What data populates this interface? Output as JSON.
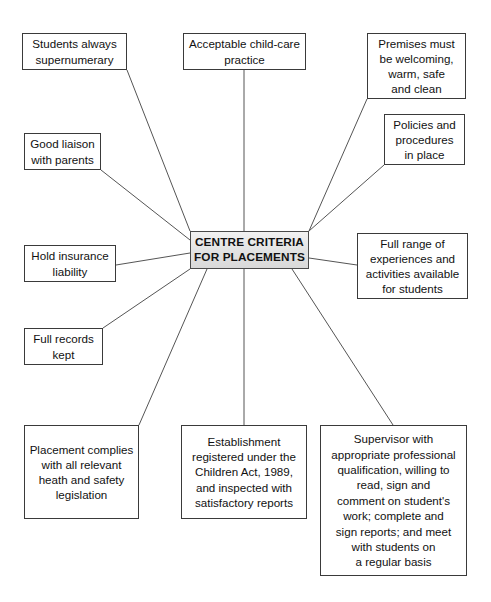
{
  "diagram": {
    "title": "CENTRE CRITERIA FOR PLACEMENTS",
    "type": "radial-spider-map",
    "center": {
      "id": "centre-criteria",
      "label": "CENTRE CRITERIA\nFOR PLACEMENTS",
      "fill_color": "#e3e3e3",
      "border_color": "#4a4a4a",
      "x": 190,
      "y": 231,
      "width": 119,
      "height": 38
    },
    "line_color": "#555555",
    "background_color": "#ffffff",
    "text_color": "#111111",
    "nodes": [
      {
        "id": "students-supernumerary",
        "label": "Students always\nsupernumerary",
        "x": 22,
        "y": 33,
        "width": 105,
        "height": 37,
        "anchor": "bottom-right"
      },
      {
        "id": "acceptable-childcare-practice",
        "label": "Acceptable child-care\npractice",
        "x": 183,
        "y": 33,
        "width": 123,
        "height": 37,
        "anchor": "bottom-center"
      },
      {
        "id": "premises-welcoming",
        "label": "Premises must\nbe welcoming,\nwarm, safe\nand clean",
        "x": 367,
        "y": 33,
        "width": 99,
        "height": 66,
        "anchor": "bottom-left"
      },
      {
        "id": "policies-procedures",
        "label": "Policies and\nprocedures\nin place",
        "x": 384,
        "y": 114,
        "width": 81,
        "height": 51,
        "anchor": "bottom-left"
      },
      {
        "id": "full-range-experiences",
        "label": "Full range of\nexperiences and\nactivities available\nfor students",
        "x": 357,
        "y": 233,
        "width": 111,
        "height": 66,
        "anchor": "left-center"
      },
      {
        "id": "good-liaison-parents",
        "label": "Good liaison\nwith parents",
        "x": 24,
        "y": 133,
        "width": 77,
        "height": 37,
        "anchor": "bottom-right"
      },
      {
        "id": "hold-insurance-liability",
        "label": "Hold insurance\nliability",
        "x": 24,
        "y": 245,
        "width": 92,
        "height": 37,
        "anchor": "right-center"
      },
      {
        "id": "full-records-kept",
        "label": "Full records\nkept",
        "x": 24,
        "y": 328,
        "width": 79,
        "height": 37,
        "anchor": "top-right"
      },
      {
        "id": "placement-health-safety",
        "label": "Placement complies\nwith all relevant\nheath and safety\nlegislation",
        "x": 24,
        "y": 425,
        "width": 115,
        "height": 94,
        "anchor": "top-right"
      },
      {
        "id": "establishment-registered",
        "label": "Establishment\nregistered under the\nChildren Act, 1989,\nand inspected with\nsatisfactory reports",
        "x": 181,
        "y": 425,
        "width": 126,
        "height": 94,
        "anchor": "top-center"
      },
      {
        "id": "supervisor-qualification",
        "label": "Supervisor with\nappropriate professional\nqualification, willing to\nread, sign and\ncomment on student's\nwork; complete and\nsign reports; and meet\nwith students on\na regular basis",
        "x": 320,
        "y": 425,
        "width": 147,
        "height": 151,
        "anchor": "top-center"
      }
    ],
    "connectors": [
      {
        "from": "students-supernumerary",
        "to": "centre-criteria",
        "x1": 127,
        "y1": 70,
        "x2": 190,
        "y2": 231
      },
      {
        "from": "acceptable-childcare-practice",
        "to": "centre-criteria",
        "x1": 244,
        "y1": 70,
        "x2": 244,
        "y2": 231
      },
      {
        "from": "premises-welcoming",
        "to": "centre-criteria",
        "x1": 367,
        "y1": 99,
        "x2": 309,
        "y2": 231
      },
      {
        "from": "policies-procedures",
        "to": "centre-criteria",
        "x1": 384,
        "y1": 165,
        "x2": 309,
        "y2": 231
      },
      {
        "from": "full-range-experiences",
        "to": "centre-criteria",
        "x1": 357,
        "y1": 265,
        "x2": 309,
        "y2": 258
      },
      {
        "from": "good-liaison-parents",
        "to": "centre-criteria",
        "x1": 101,
        "y1": 170,
        "x2": 190,
        "y2": 240
      },
      {
        "from": "hold-insurance-liability",
        "to": "centre-criteria",
        "x1": 116,
        "y1": 265,
        "x2": 190,
        "y2": 253
      },
      {
        "from": "full-records-kept",
        "to": "centre-criteria",
        "x1": 103,
        "y1": 328,
        "x2": 190,
        "y2": 269
      },
      {
        "from": "placement-health-safety",
        "to": "centre-criteria",
        "x1": 139,
        "y1": 425,
        "x2": 207,
        "y2": 269
      },
      {
        "from": "establishment-registered",
        "to": "centre-criteria",
        "x1": 244,
        "y1": 425,
        "x2": 244,
        "y2": 269
      },
      {
        "from": "supervisor-qualification",
        "to": "centre-criteria",
        "x1": 393,
        "y1": 425,
        "x2": 292,
        "y2": 269
      }
    ]
  }
}
